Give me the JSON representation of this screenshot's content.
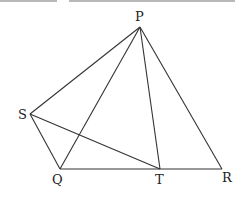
{
  "diagram": {
    "type": "geometry",
    "points": {
      "P": {
        "label": "P",
        "x": 140,
        "y": 27,
        "lx": 135,
        "ly": 21
      },
      "S": {
        "label": "S",
        "x": 30,
        "y": 114,
        "lx": 18,
        "ly": 119
      },
      "Q": {
        "label": "Q",
        "x": 60,
        "y": 169,
        "lx": 52,
        "ly": 184
      },
      "T": {
        "label": "T",
        "x": 160,
        "y": 169,
        "lx": 155,
        "ly": 184
      },
      "R": {
        "label": "R",
        "x": 222,
        "y": 169,
        "lx": 222,
        "ly": 182
      }
    },
    "segments": [
      [
        "P",
        "S"
      ],
      [
        "P",
        "Q"
      ],
      [
        "P",
        "T"
      ],
      [
        "P",
        "R"
      ],
      [
        "S",
        "Q"
      ],
      [
        "S",
        "T"
      ],
      [
        "Q",
        "R"
      ]
    ],
    "colors": {
      "line": "#333333",
      "label": "#222222",
      "topbar": "#b8b8b8"
    }
  }
}
